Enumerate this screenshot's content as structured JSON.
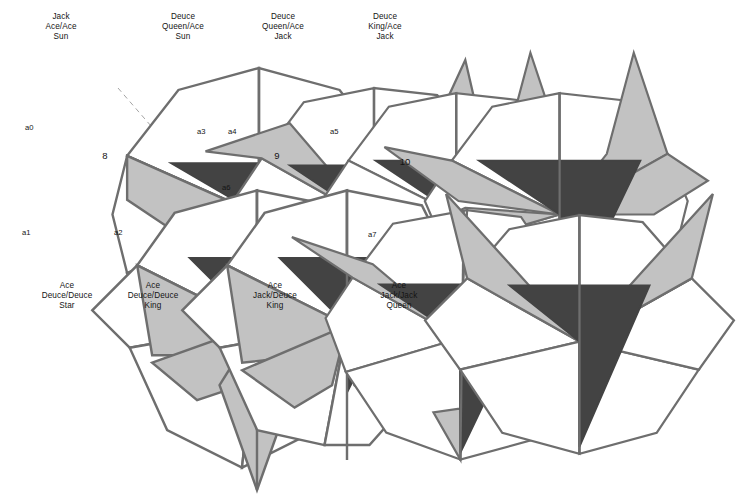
{
  "figure": {
    "title_present": false,
    "background_color": "#ffffff",
    "palette": {
      "outline": "#6e6e6e",
      "white_face": "#ffffff",
      "light_face": "#c2c2c2",
      "dark_face": "#434343",
      "dashed_partition": "#9a9a9a",
      "text": "#141414"
    }
  },
  "group_labels": [
    {
      "id": "group-8",
      "text": "8",
      "x": 104,
      "y": 150
    },
    {
      "id": "group-9",
      "text": "9",
      "x": 276,
      "y": 150
    },
    {
      "id": "group-10",
      "text": "10",
      "x": 404,
      "y": 156
    }
  ],
  "partitions": [
    {
      "id": "partition-left",
      "points": "118,88 278,272"
    },
    {
      "id": "partition-right",
      "points": "278,272 430,125"
    }
  ],
  "items": [
    {
      "id": "a0",
      "label": "a0",
      "caption_position": "top",
      "caption_lines": [
        "Jack",
        "Ace/Ace",
        "Sun"
      ],
      "caption_text": "Jack\nAce/Ace\nSun",
      "group": "8",
      "label_x": 25,
      "label_y": 123,
      "caption_x": 18,
      "caption_y": 12,
      "fig_x": 24,
      "fig_y": 46
    },
    {
      "id": "a3",
      "label": "a3",
      "caption_position": "top",
      "caption_lines": [
        "Deuce",
        "Queen/Ace",
        "Sun"
      ],
      "caption_text": "Deuce\nQueen/Ace\nSun",
      "group": "8",
      "label_x": 197,
      "label_y": 127,
      "caption_x": 138,
      "caption_y": 12,
      "fig_x": 132,
      "fig_y": 46
    },
    {
      "id": "a4",
      "label": "a4",
      "caption_position": "top",
      "caption_lines": [
        "Deuce",
        "Queen/Ace",
        "Jack"
      ],
      "caption_text": "Deuce\nQueen/Ace\nJack",
      "group": "9",
      "label_x": 228,
      "label_y": 127,
      "caption_x": 238,
      "caption_y": 12,
      "fig_x": 228,
      "fig_y": 46
    },
    {
      "id": "a5",
      "label": "a5",
      "caption_position": "top",
      "caption_lines": [
        "Deuce",
        "King/Ace",
        "Jack"
      ],
      "caption_text": "Deuce\nKing/Ace\nJack",
      "group": "9",
      "label_x": 330,
      "label_y": 127,
      "caption_x": 340,
      "caption_y": 12,
      "fig_x": 328,
      "fig_y": 46
    },
    {
      "id": "a1",
      "label": "a1",
      "caption_position": "bottom",
      "caption_lines": [
        "Ace",
        "Deuce/Deuce",
        "Star"
      ],
      "caption_text": "Ace\nDeuce/Deuce\nStar",
      "group": "8",
      "label_x": 22,
      "label_y": 228,
      "caption_x": 20,
      "caption_y": 281,
      "fig_x": 22,
      "fig_y": 168
    },
    {
      "id": "a2",
      "label": "a2",
      "caption_position": "bottom",
      "caption_lines": [
        "Ace",
        "Deuce/Deuce",
        "King"
      ],
      "caption_text": "Ace\nDeuce/Deuce\nKing",
      "group": "8",
      "label_x": 114,
      "label_y": 228,
      "caption_x": 106,
      "caption_y": 281,
      "fig_x": 112,
      "fig_y": 168
    },
    {
      "id": "a6",
      "label": "a6",
      "caption_position": "bottom",
      "caption_lines": [
        "Ace",
        "Jack/Deuce",
        "King"
      ],
      "caption_text": "Ace\nJack/Deuce\nKing",
      "group": "9",
      "label_x": 222,
      "label_y": 183,
      "caption_x": 228,
      "caption_y": 281,
      "fig_x": 222,
      "fig_y": 163
    },
    {
      "id": "a7",
      "label": "a7",
      "caption_position": "bottom",
      "caption_lines": [
        "Ace",
        "Jack/Jack",
        "Queen"
      ],
      "caption_text": "Ace\nJack/Jack\nQueen",
      "group": "10",
      "label_x": 368,
      "label_y": 230,
      "caption_x": 352,
      "caption_y": 281,
      "fig_x": 355,
      "fig_y": 166
    }
  ]
}
